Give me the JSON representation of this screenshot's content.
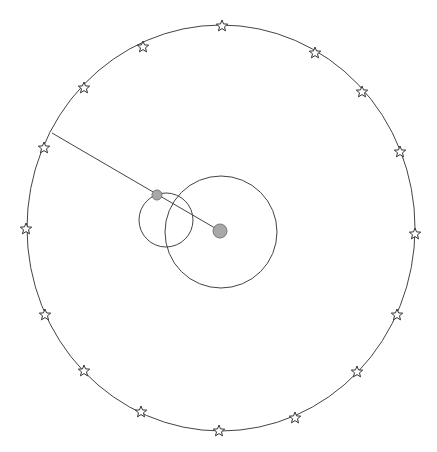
{
  "diagram": {
    "type": "orbital-diagram",
    "background": "#ffffff",
    "stroke_color": "#444444",
    "fill_color": "#a8a8a8",
    "outer_ring": {
      "cx": 221,
      "cy": 228,
      "rx": 194,
      "ry": 203
    },
    "large_circle": {
      "cx": 221,
      "cy": 232,
      "r": 56
    },
    "small_circle": {
      "cx": 166,
      "cy": 220,
      "r": 27
    },
    "center_ball": {
      "cx": 220,
      "cy": 231,
      "r": 7
    },
    "orbiting_ball": {
      "cx": 157,
      "cy": 195,
      "r": 5
    },
    "pointer_line": {
      "x1": 52,
      "y1": 133,
      "x2": 220,
      "y2": 231
    },
    "stars": [
      {
        "x": 222,
        "y": 26
      },
      {
        "x": 315,
        "y": 53
      },
      {
        "x": 362,
        "y": 92
      },
      {
        "x": 400,
        "y": 152
      },
      {
        "x": 415,
        "y": 234
      },
      {
        "x": 397,
        "y": 315
      },
      {
        "x": 357,
        "y": 372
      },
      {
        "x": 295,
        "y": 418
      },
      {
        "x": 219,
        "y": 431
      },
      {
        "x": 141,
        "y": 412
      },
      {
        "x": 84,
        "y": 371
      },
      {
        "x": 45,
        "y": 315
      },
      {
        "x": 26,
        "y": 229
      },
      {
        "x": 44,
        "y": 148
      },
      {
        "x": 84,
        "y": 88
      },
      {
        "x": 143,
        "y": 47
      }
    ]
  }
}
